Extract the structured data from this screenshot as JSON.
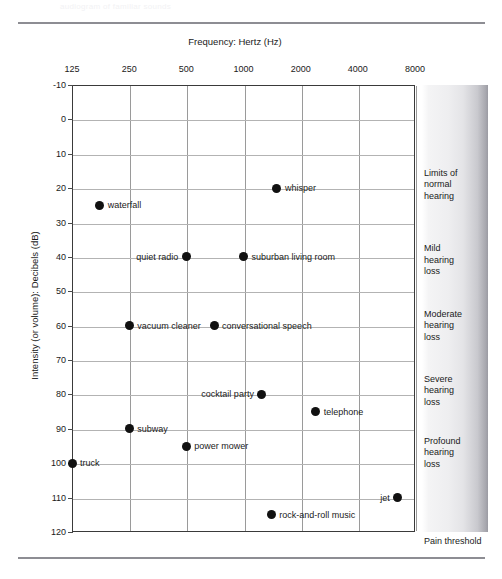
{
  "page": {
    "ghost_caption": "audiogram of familiar sounds"
  },
  "chart_data": {
    "type": "scatter",
    "title": "",
    "xlabel": "Frequency: Hertz (Hz)",
    "ylabel": "Intensity (or volume): Decibels (dB)",
    "x_scale": "log",
    "x_ticks": [
      125,
      250,
      500,
      1000,
      2000,
      4000,
      8000
    ],
    "x_tick_labels": [
      "125",
      "250",
      "500",
      "1000",
      "2000",
      "4000",
      "8000"
    ],
    "xlim": [
      125,
      8000
    ],
    "y_ticks": [
      -10,
      0,
      10,
      20,
      30,
      40,
      50,
      60,
      70,
      80,
      90,
      100,
      110,
      120
    ],
    "y_tick_labels": [
      "-10",
      "0",
      "10",
      "20",
      "30",
      "40",
      "50",
      "60",
      "70",
      "80",
      "90",
      "100",
      "110",
      "120"
    ],
    "ylim": [
      -10,
      120
    ],
    "y_inverted": true,
    "grid": true,
    "legend": "none",
    "points": [
      {
        "label": "whisper",
        "x": 1500,
        "y": 20,
        "label_side": "right"
      },
      {
        "label": "waterfall",
        "x": 175,
        "y": 25,
        "label_side": "right"
      },
      {
        "label": "quiet radio",
        "x": 500,
        "y": 40,
        "label_side": "left"
      },
      {
        "label": "suburban living room",
        "x": 1000,
        "y": 40,
        "label_side": "right"
      },
      {
        "label": "vacuum cleaner",
        "x": 250,
        "y": 60,
        "label_side": "right"
      },
      {
        "label": "conversational speech",
        "x": 700,
        "y": 60,
        "label_side": "right"
      },
      {
        "label": "cocktail party",
        "x": 1250,
        "y": 80,
        "label_side": "left"
      },
      {
        "label": "telephone",
        "x": 2400,
        "y": 85,
        "label_side": "right"
      },
      {
        "label": "subway",
        "x": 250,
        "y": 90,
        "label_side": "right"
      },
      {
        "label": "power mower",
        "x": 500,
        "y": 95,
        "label_side": "right"
      },
      {
        "label": "truck",
        "x": 125,
        "y": 100,
        "label_side": "right"
      },
      {
        "label": "jet",
        "x": 6500,
        "y": 110,
        "label_side": "left"
      },
      {
        "label": "rock-and-roll music",
        "x": 1400,
        "y": 115,
        "label_side": "right"
      }
    ]
  },
  "severity_scale": {
    "bands": [
      {
        "name": "limits-of-normal-hearing",
        "text": "Limits of\nnormal\nhearing",
        "top_db": 14
      },
      {
        "name": "mild-hearing-loss",
        "text": "Mild\nhearing\nloss",
        "top_db": 36
      },
      {
        "name": "moderate-hearing-loss",
        "text": "Moderate\nhearing\nloss",
        "top_db": 55
      },
      {
        "name": "severe-hearing-loss",
        "text": "Severe\nhearing\nloss",
        "top_db": 74
      },
      {
        "name": "profound-hearing-loss",
        "text": "Profound\nhearing\nloss",
        "top_db": 92
      }
    ],
    "pain_threshold_label": "Pain threshold",
    "gradient_light": "#ffffff",
    "gradient_dark": "#9b9ba3"
  }
}
